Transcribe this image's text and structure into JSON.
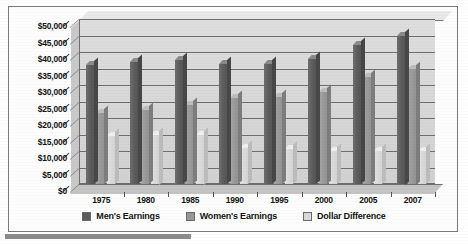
{
  "chart_data": {
    "type": "bar",
    "title": "",
    "xlabel": "",
    "ylabel": "",
    "categories": [
      "1975",
      "1980",
      "1985",
      "1990",
      "1995",
      "2000",
      "2005",
      "2007"
    ],
    "series": [
      {
        "name": "Men's Earnings",
        "color": "#5b5b5b",
        "values": [
          36000,
          37000,
          37500,
          36500,
          36500,
          38000,
          42000,
          45000
        ]
      },
      {
        "name": "Women's Earnings",
        "color": "#999999",
        "values": [
          21500,
          22500,
          24000,
          26000,
          26500,
          28000,
          32500,
          35000
        ]
      },
      {
        "name": "Dollar Difference",
        "color": "#d9d9d9",
        "values": [
          14500,
          15000,
          15000,
          11000,
          10500,
          10000,
          10000,
          10000
        ]
      }
    ],
    "ylim": [
      0,
      50000
    ],
    "ytick_step": 5000,
    "ytick_labels": [
      "$50,000",
      "$45,000",
      "$40,000",
      "$35,000",
      "$30,000",
      "$25,000",
      "$20,000",
      "$15,000",
      "$10,000",
      "$5,000",
      "$0"
    ],
    "ytick_values": [
      50000,
      45000,
      40000,
      35000,
      30000,
      25000,
      20000,
      15000,
      10000,
      5000,
      0
    ],
    "grid": true,
    "legend_position": "bottom",
    "style": "3d-clustered-column"
  },
  "legend": {
    "items": [
      {
        "label": "Men's Earnings",
        "color": "#5b5b5b"
      },
      {
        "label": "Women's Earnings",
        "color": "#999999"
      },
      {
        "label": "Dollar Difference",
        "color": "#d9d9d9"
      }
    ]
  }
}
